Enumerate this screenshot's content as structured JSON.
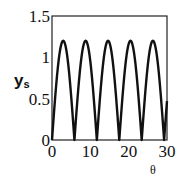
{
  "chart_data": {
    "type": "line",
    "title": "",
    "xlabel": "θ",
    "ylabel": "ys",
    "ylabel_main": "y",
    "ylabel_sub": "s",
    "xlim": [
      0,
      30
    ],
    "ylim": [
      0,
      1.5
    ],
    "xticks": [
      0,
      10,
      20,
      30
    ],
    "xtick_labels": [
      "0",
      "10",
      "20",
      "30"
    ],
    "yticks": [
      0,
      0.5,
      1,
      1.5
    ],
    "ytick_labels": [
      "0",
      "0.5",
      "1",
      "1.5"
    ],
    "grid": false,
    "legend": null,
    "series": [
      {
        "name": "ys",
        "description": "periodic rectified-sine-like oscillation, amplitude ~1.2, period ~5.85",
        "amplitude": 1.2,
        "period": 5.85,
        "x": [
          0,
          2.9,
          5.85,
          8.75,
          11.7,
          14.6,
          17.55,
          20.5,
          23.4,
          26.3,
          29.25,
          30
        ],
        "values": [
          0,
          1.2,
          0,
          1.2,
          0,
          1.2,
          0,
          1.2,
          0,
          1.2,
          0,
          0.45
        ]
      }
    ],
    "color": "#111111"
  }
}
